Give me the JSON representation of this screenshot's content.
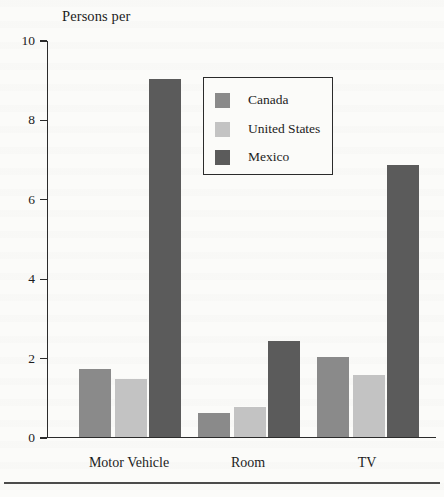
{
  "chart_data": {
    "type": "bar",
    "title": "Persons per",
    "xlabel": "",
    "ylabel": "",
    "categories": [
      "Motor Vehicle",
      "Room",
      "TV"
    ],
    "series": [
      {
        "name": "Canada",
        "color": "#8a8a8a",
        "values": [
          1.7,
          0.6,
          2.0
        ]
      },
      {
        "name": "United States",
        "color": "#c3c3c3",
        "values": [
          1.45,
          0.75,
          1.55
        ]
      },
      {
        "name": "Mexico",
        "color": "#5b5b5b",
        "values": [
          9.0,
          2.4,
          6.85
        ]
      }
    ],
    "ylim": [
      0,
      10
    ],
    "yticks": [
      0,
      2,
      4,
      6,
      8,
      10
    ],
    "ytick_labels": [
      "0",
      "2",
      "4",
      "6",
      "8",
      "10"
    ],
    "grid": false,
    "legend_position": "upper center"
  }
}
